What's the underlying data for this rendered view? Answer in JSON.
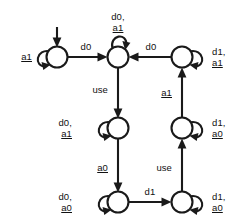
{
  "diagram": {
    "type": "finite-state-machine",
    "stroke_color": "#1a1a1a",
    "background_color": "#ffffff",
    "states": [
      {
        "id": "s0",
        "name": "state-top-left",
        "cx": 57,
        "cy": 57,
        "r": 10.5,
        "initial": true
      },
      {
        "id": "s1",
        "name": "state-top-middle",
        "cx": 118,
        "cy": 57,
        "r": 10.5,
        "initial": false
      },
      {
        "id": "s2",
        "name": "state-top-right",
        "cx": 182,
        "cy": 57,
        "r": 10.5,
        "initial": false
      },
      {
        "id": "s3",
        "name": "state-middle-left",
        "cx": 118,
        "cy": 128,
        "r": 10.5,
        "initial": false
      },
      {
        "id": "s4",
        "name": "state-middle-right",
        "cx": 182,
        "cy": 128,
        "r": 10.5,
        "initial": false
      },
      {
        "id": "s5",
        "name": "state-bottom-left",
        "cx": 118,
        "cy": 202,
        "r": 10.5,
        "initial": false
      },
      {
        "id": "s6",
        "name": "state-bottom-right",
        "cx": 182,
        "cy": 202,
        "r": 10.5,
        "initial": false
      }
    ],
    "self_loops": [
      {
        "state": "s0",
        "side": "left",
        "label_lines": [
          "a1"
        ],
        "underlined": [
          "a1"
        ]
      },
      {
        "state": "s1",
        "side": "top",
        "label_lines": [
          "d0,",
          "a1"
        ],
        "underlined": [
          "a1"
        ]
      },
      {
        "state": "s2",
        "side": "right",
        "label_lines": [
          "d1,",
          "a1"
        ],
        "underlined": [
          "a1"
        ]
      },
      {
        "state": "s3",
        "side": "left",
        "label_lines": [
          "d0,",
          "a1"
        ],
        "underlined": [
          "a1"
        ]
      },
      {
        "state": "s4",
        "side": "right",
        "label_lines": [
          "d1,",
          "a0"
        ],
        "underlined": [
          "a0"
        ]
      },
      {
        "state": "s5",
        "side": "left",
        "label_lines": [
          "d0,",
          "a0"
        ],
        "underlined": [
          "a0"
        ]
      },
      {
        "state": "s6",
        "side": "right",
        "label_lines": [
          "d1,",
          "a0"
        ],
        "underlined": [
          "a0"
        ]
      }
    ],
    "transitions": [
      {
        "from": "s0",
        "to": "s1",
        "label": "d0",
        "underlined": false,
        "direction": "right"
      },
      {
        "from": "s2",
        "to": "s1",
        "label": "d0",
        "underlined": false,
        "direction": "left"
      },
      {
        "from": "s1",
        "to": "s3",
        "label": "use",
        "underlined": false,
        "direction": "down"
      },
      {
        "from": "s3",
        "to": "s5",
        "label": "a0",
        "underlined": true,
        "direction": "down"
      },
      {
        "from": "s5",
        "to": "s6",
        "label": "d1",
        "underlined": false,
        "direction": "right"
      },
      {
        "from": "s6",
        "to": "s4",
        "label": "use",
        "underlined": false,
        "direction": "up"
      },
      {
        "from": "s4",
        "to": "s2",
        "label": "a1",
        "underlined": true,
        "direction": "up"
      }
    ],
    "labels": {
      "loop_s0": {
        "line1": "a1"
      },
      "loop_s1": {
        "line1": "d0,",
        "line2": "a1"
      },
      "loop_s2": {
        "line1": "d1,",
        "line2": "a1"
      },
      "loop_s3": {
        "line1": "d0,",
        "line2": "a1"
      },
      "loop_s4": {
        "line1": "d1,",
        "line2": "a0"
      },
      "loop_s5": {
        "line1": "d0,",
        "line2": "a0"
      },
      "loop_s6": {
        "line1": "d1,",
        "line2": "a0"
      },
      "edge_top_left": "d0",
      "edge_top_right": "d0",
      "edge_use_left": "use",
      "edge_a0_left": "a0",
      "edge_d1_bottom": "d1",
      "edge_use_right": "use",
      "edge_a1_right": "a1"
    }
  }
}
